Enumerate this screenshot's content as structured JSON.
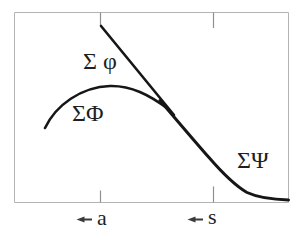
{
  "figure": {
    "background": "#ffffff",
    "colors": {
      "frame": "#b4b4b4",
      "tick": "#909090",
      "curve": "#161616",
      "text": "#1f1f1f",
      "arrow": "#3a3a3a"
    },
    "labels": {
      "tangent_line": "Σ φ",
      "hump_curve": "ΣΦ",
      "merged_curve": "ΣΨ",
      "marker_a": "a",
      "marker_s": "s"
    },
    "paths": {
      "frame": "M14.5,12.5 H288.5 V202.5 H14.5 Z",
      "ticks": "M100.5,12.5 V25 M213.5,12.5 V28 M100.5,190.5 V202.5 M213.5,186.5 V202.5",
      "hump_curve": "M45,128 C56,105 81,87 110,86 C131,85.5 149,94.5 169,109.5",
      "tangent_line": "M101,26 L174,115",
      "merged_curve": "M160,100.5 C175,118 197,144 209,157.5 C222,172.5 234,185 247,192.5 C259,198 271,199.5 288.5,200",
      "arrow_a": "M76.5,219.5 L84.5,216.4 L84.5,218.6 L92,218.6 L92,220.4 L84.5,220.4 L84.5,222.6 Z",
      "arrow_s": "M187.5,219.5 L195.5,216.4 L195.5,218.6 L203,218.6 L203,220.4 L195.5,220.4 L195.5,222.6 Z"
    }
  }
}
